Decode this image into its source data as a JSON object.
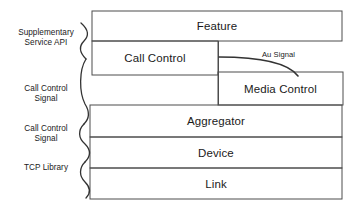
{
  "diagram": {
    "type": "layered-architecture",
    "stroke_color": "#4d4d4d",
    "text_color": "#1a1a1a",
    "background_color": "#ffffff",
    "layers": [
      {
        "id": "feature",
        "label": "Feature",
        "x": 92,
        "y": 11,
        "w": 250,
        "h": 30
      },
      {
        "id": "call-control",
        "label": "Call Control",
        "x": 92,
        "y": 41,
        "w": 126,
        "h": 34
      },
      {
        "id": "media-control",
        "label": "Media Control",
        "x": 218,
        "y": 72,
        "w": 125,
        "h": 33
      },
      {
        "id": "aggregator",
        "label": "Aggregator",
        "x": 90,
        "y": 105,
        "w": 252,
        "h": 32
      },
      {
        "id": "device",
        "label": "Device",
        "x": 90,
        "y": 137,
        "w": 252,
        "h": 31
      },
      {
        "id": "link",
        "label": "Link",
        "x": 90,
        "y": 168,
        "w": 252,
        "h": 31
      }
    ],
    "side_labels": [
      {
        "id": "supplementary-service-api",
        "label": "Supplementary\nService API",
        "x": 10,
        "y": 28,
        "w": 72
      },
      {
        "id": "call-control-signal-upper",
        "label": "Call Control\nSignal",
        "x": 12,
        "y": 84,
        "w": 68
      },
      {
        "id": "call-control-signal-lower",
        "label": "Call Control\nSignal",
        "x": 12,
        "y": 124,
        "w": 68
      },
      {
        "id": "tcp-library",
        "label": "TCP Library",
        "x": 12,
        "y": 163,
        "w": 68
      }
    ],
    "edge_labels": [
      {
        "id": "au-signal",
        "label": "Au Signal",
        "x": 262,
        "y": 50
      }
    ]
  }
}
